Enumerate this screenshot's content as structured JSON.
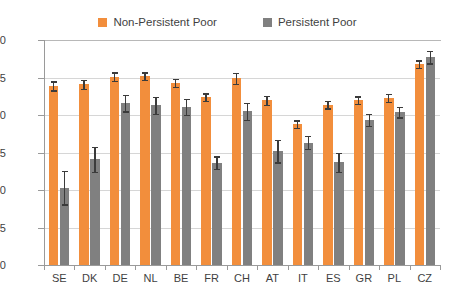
{
  "legend": {
    "entries": [
      {
        "label": "Non-Persistent Poor",
        "color": "#F28E3C",
        "icon": "square-swatch-icon"
      },
      {
        "label": "Persistent Poor",
        "color": "#808080",
        "icon": "square-swatch-icon"
      }
    ]
  },
  "axis": {
    "y_tick_labels": [
      "0.80",
      "0.75",
      "0.70",
      "0.65",
      "0.60",
      "0.55",
      "0.50"
    ],
    "x_tick_labels": [
      "SE",
      "DK",
      "DE",
      "NL",
      "BE",
      "FR",
      "CH",
      "AT",
      "IT",
      "ES",
      "GR",
      "PL",
      "CZ"
    ]
  },
  "chart_data": {
    "type": "bar",
    "title": "",
    "subtitle": "",
    "xlabel": "",
    "ylabel": "",
    "ylim": [
      0.5,
      0.8
    ],
    "ytick_step": 0.05,
    "yticks": [
      0.5,
      0.55,
      0.6,
      0.65,
      0.7,
      0.75,
      0.8
    ],
    "grid": true,
    "legend_position": "top-center",
    "error_bars": true,
    "categories": [
      "SE",
      "DK",
      "DE",
      "NL",
      "BE",
      "FR",
      "CH",
      "AT",
      "IT",
      "ES",
      "GR",
      "PL",
      "CZ"
    ],
    "series": [
      {
        "name": "Non-Persistent Poor",
        "color": "#F28E3C",
        "values": [
          0.739,
          0.741,
          0.751,
          0.752,
          0.743,
          0.724,
          0.749,
          0.72,
          0.688,
          0.714,
          0.72,
          0.723,
          0.768
        ],
        "err_low": [
          0.733,
          0.735,
          0.746,
          0.747,
          0.738,
          0.719,
          0.742,
          0.714,
          0.683,
          0.709,
          0.715,
          0.718,
          0.763
        ],
        "err_high": [
          0.745,
          0.747,
          0.757,
          0.757,
          0.748,
          0.729,
          0.756,
          0.726,
          0.693,
          0.719,
          0.725,
          0.728,
          0.773
        ]
      },
      {
        "name": "Persistent Poor",
        "color": "#808080",
        "values": [
          0.603,
          0.641,
          0.716,
          0.713,
          0.711,
          0.636,
          0.705,
          0.652,
          0.663,
          0.637,
          0.694,
          0.704,
          0.777
        ],
        "err_low": [
          0.581,
          0.624,
          0.705,
          0.702,
          0.7,
          0.628,
          0.694,
          0.637,
          0.655,
          0.624,
          0.686,
          0.697,
          0.769
        ],
        "err_high": [
          0.626,
          0.658,
          0.727,
          0.724,
          0.722,
          0.645,
          0.716,
          0.667,
          0.672,
          0.65,
          0.702,
          0.711,
          0.786
        ]
      }
    ]
  }
}
